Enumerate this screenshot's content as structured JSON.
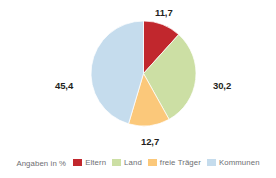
{
  "chart_data": {
    "type": "pie",
    "title": "",
    "subtitle": "",
    "xlabel": "",
    "ylabel": "",
    "legend_position": "bottom",
    "legend_caption": "Angaben in %",
    "grid": false,
    "start_angle_deg": 0,
    "direction": "clockwise",
    "categories": [
      "Eltern",
      "Land",
      "freie Träger",
      "Kommunen"
    ],
    "values": [
      11.7,
      30.2,
      12.7,
      45.4
    ],
    "value_labels": [
      "11,7",
      "30,2",
      "12,7",
      "45,4"
    ],
    "colors": [
      "#c1272d",
      "#ccdfa4",
      "#fbc87a",
      "#c5dced"
    ],
    "slices": [
      {
        "label": "Eltern",
        "value": 11.7,
        "value_label": "11,7",
        "color": "#c1272d"
      },
      {
        "label": "Land",
        "value": 30.2,
        "value_label": "30,2",
        "color": "#ccdfa4"
      },
      {
        "label": "freie Träger",
        "value": 12.7,
        "value_label": "12,7",
        "color": "#fbc87a"
      },
      {
        "label": "Kommunen",
        "value": 45.4,
        "value_label": "45,4",
        "color": "#c5dced"
      }
    ]
  },
  "legend": {
    "caption": "Angaben in %",
    "items": [
      {
        "label": "Eltern",
        "color": "#c1272d"
      },
      {
        "label": "Land",
        "color": "#ccdfa4"
      },
      {
        "label": "freie Träger",
        "color": "#fbc87a"
      },
      {
        "label": "Kommunen",
        "color": "#c5dced"
      }
    ]
  },
  "theme": {
    "background": "#ffffff",
    "label_color": "#231f20",
    "legend_text_color": "#6d6e71"
  }
}
